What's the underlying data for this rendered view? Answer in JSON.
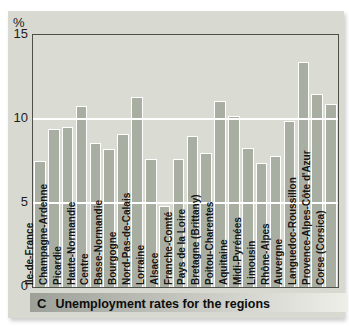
{
  "figure": {
    "y_axis_unit": "%",
    "caption_letter": "C",
    "caption_text": "Unemployment rates for the regions"
  },
  "colors": {
    "panel_bg": "#d8dad2",
    "plot_bg": "#dadcd4",
    "bar_fill": "#a9aea3",
    "bar_outline": "#ffffff",
    "gridline": "#ffffff",
    "plot_border": "#4f4f49",
    "caption_gradient_left": "#9da098",
    "caption_gradient_right": "#eeefe9",
    "text": "#141414"
  },
  "chart_data": {
    "type": "bar",
    "title": "Unemployment rates for the regions",
    "xlabel": "",
    "ylabel": "%",
    "ylim": [
      0,
      15
    ],
    "yticks": [
      0,
      5,
      10,
      15
    ],
    "gridlines": [
      5,
      10
    ],
    "grid": "horizontal white lines at 5 and 10 drawn over bars",
    "legend_position": "none",
    "categories": [
      "Ile-de-France",
      "Champagne-Ardenne",
      "Picardie",
      "Haute-Normandie",
      "Centre",
      "Basse-Normandie",
      "Bourgogne",
      "Nord-Pas-de-Calais",
      "Lorraine",
      "Alsace",
      "Franche-Comté",
      "Pays de la Loire",
      "Bretagne (Brittany)",
      "Poitou-Charentes",
      "Aquitaine",
      "Midi-Pyrénées",
      "Limousin",
      "Rhône-Alpes",
      "Auvergne",
      "Languedoc-Roussillon",
      "Provence-Alpes-Côte d'Azur",
      "Corse (Corsica)"
    ],
    "values": [
      7.5,
      9.4,
      9.5,
      10.8,
      8.6,
      8.2,
      9.1,
      11.3,
      7.6,
      4.8,
      7.6,
      9.0,
      8.0,
      11.1,
      10.2,
      8.3,
      7.4,
      7.8,
      9.9,
      13.4,
      11.5,
      10.9
    ]
  }
}
